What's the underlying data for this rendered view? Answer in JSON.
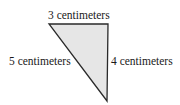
{
  "diagram": {
    "type": "right-triangle",
    "fill_color": "#e6e6e6",
    "stroke_color": "#2a2a2a",
    "labels": {
      "top": "3 centimeters",
      "hypotenuse": "5 centimeters",
      "right": "4 centimeters"
    }
  }
}
